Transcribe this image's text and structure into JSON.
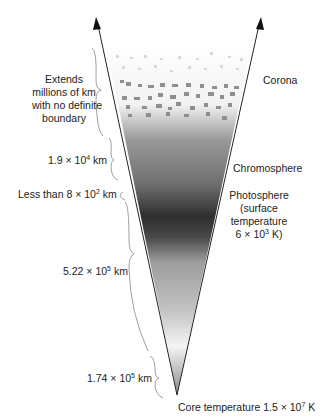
{
  "diagram": {
    "layers_right": [
      {
        "name": "Corona"
      },
      {
        "name": "Chromosphere"
      },
      {
        "name": "Photosphere",
        "detail_lines": [
          "(surface",
          "temperature"
        ],
        "temp_base": "6 × 10",
        "temp_exp": "3",
        "temp_unit": " K)"
      }
    ],
    "extents_left": [
      {
        "lines": [
          "Extends",
          "millions of km",
          "with no definite",
          "boundary"
        ]
      },
      {
        "base": "1.9 × 10",
        "exp": "4",
        "unit": " km"
      },
      {
        "prefix": "Less than 8 × 10",
        "exp": "2",
        "unit": " km"
      },
      {
        "base": "5.22 × 10",
        "exp": "5",
        "unit": " km"
      },
      {
        "base": "1.74 × 10",
        "exp": "5",
        "unit": " km"
      }
    ],
    "core": {
      "prefix": "Core temperature 1.5 × 10",
      "exp": "7",
      "unit": " K"
    }
  }
}
